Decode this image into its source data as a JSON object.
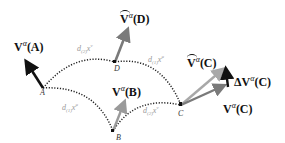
{
  "diagram": {
    "type": "parallel-transport",
    "points": [
      {
        "id": "A",
        "label": "A"
      },
      {
        "id": "B",
        "label": "B"
      },
      {
        "id": "C",
        "label": "C"
      },
      {
        "id": "D",
        "label": "D"
      }
    ],
    "vectors": {
      "VA": {
        "base": "V",
        "sup": "α",
        "arg": "(A)",
        "color": "#111111"
      },
      "VB": {
        "base": "V",
        "sup": "α",
        "arg": "(B)",
        "color": "#9a9a9a"
      },
      "VD": {
        "base": "V",
        "sup": "α",
        "arg": "(D)",
        "tilde": true,
        "color": "#7a7a7a"
      },
      "VCtilde": {
        "base": "V",
        "sup": "α",
        "arg": "(C)",
        "tilde": true,
        "color": "#a8a8a8"
      },
      "VC": {
        "base": "V",
        "sup": "α",
        "arg": "(C)",
        "color": "#7a7a7a"
      },
      "dVC": {
        "base": "ΔV",
        "sup": "α",
        "arg": "(C)",
        "color": "#111111"
      }
    },
    "path_labels": {
      "AD": {
        "d": "d",
        "sub": "(2)",
        "x": "x",
        "sup": "ν"
      },
      "DC": {
        "d": "d",
        "sub": "(1)",
        "x": "x",
        "sup": "μ"
      },
      "AB": {
        "d": "d",
        "sub": "(1)",
        "x": "x",
        "sup": "μ"
      },
      "BC": {
        "d": "d",
        "sub": "(2)",
        "x": "x",
        "sup": "ν"
      }
    }
  }
}
